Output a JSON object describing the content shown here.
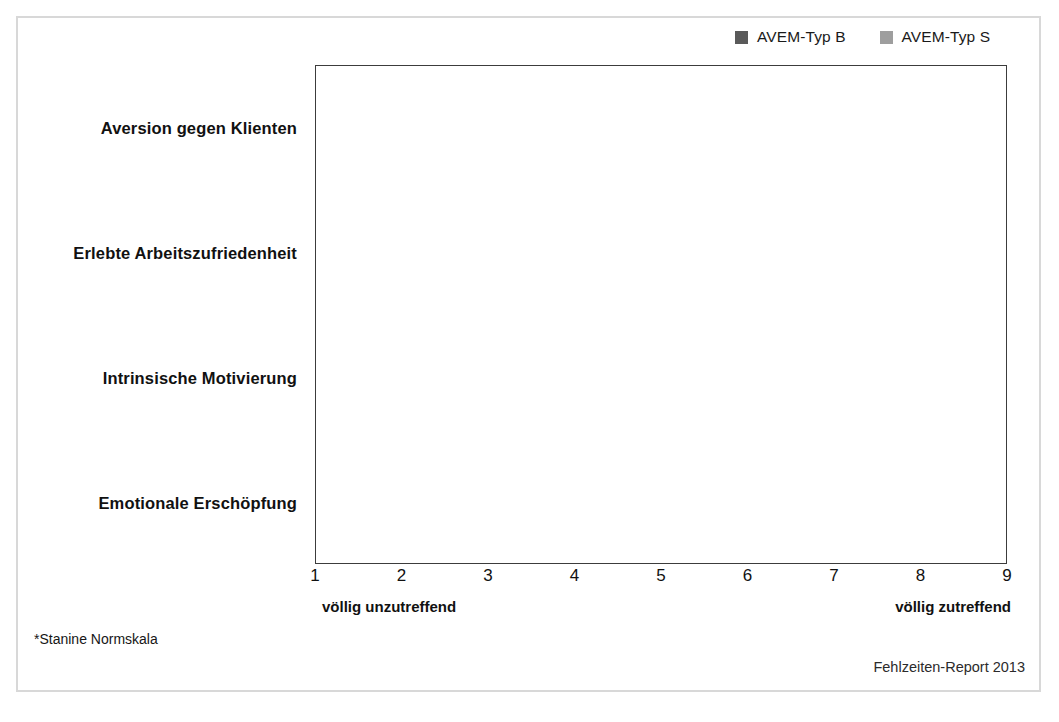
{
  "legend": {
    "items": [
      {
        "label": "AVEM-Typ B",
        "color": "#5a5a5a",
        "swatch_icon": "legend-square-icon"
      },
      {
        "label": "AVEM-Typ S",
        "color": "#9e9e9e",
        "swatch_icon": "legend-square-icon"
      }
    ]
  },
  "axis": {
    "ticks": [
      "1",
      "2",
      "3",
      "4",
      "5",
      "6",
      "7",
      "8",
      "9"
    ],
    "anchor_left": "völlig  unzutreffend",
    "anchor_right": "völlig  zutreffend"
  },
  "footnote": "*Stanine Normskala",
  "source": "Fehlzeiten-Report 2013",
  "colors": {
    "series_b": "#5a5a5a",
    "series_s": "#9e9e9e",
    "gridline": "#b9b9b9",
    "plot_border": "#3c3c3c",
    "outer_frame": "#d8d8d8"
  },
  "chart_data": {
    "type": "bar",
    "orientation": "horizontal",
    "title": "",
    "subtitle": "",
    "xlabel": "",
    "ylabel": "",
    "xlim": [
      1,
      9
    ],
    "grid": true,
    "legend_position": "top-right",
    "categories": [
      "Aversion gegen Klienten",
      "Erlebte Arbeitszufriedenheit",
      "Intrinsische Motivierung",
      "Emotionale Erschöpfung"
    ],
    "series": [
      {
        "name": "AVEM-Typ B",
        "color": "#5a5a5a",
        "values": [
          6.05,
          6.95,
          6.5,
          7.0
        ]
      },
      {
        "name": "AVEM-Typ S",
        "color": "#9e9e9e",
        "values": [
          4.85,
          5.35,
          5.7,
          4.8
        ]
      }
    ],
    "xticks": [
      1,
      2,
      3,
      4,
      5,
      6,
      7,
      8,
      9
    ],
    "annotations": {
      "left_anchor": "völlig  unzutreffend",
      "right_anchor": "völlig  zutreffend",
      "footnote": "*Stanine Normskala",
      "source": "Fehlzeiten-Report 2013"
    }
  }
}
